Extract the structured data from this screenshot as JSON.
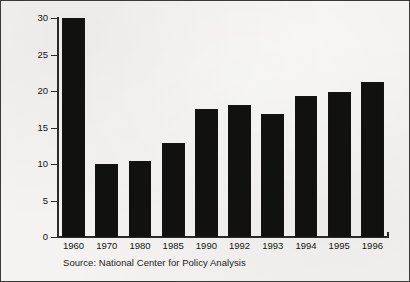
{
  "chart_data": {
    "type": "bar",
    "title": "",
    "xlabel": "",
    "ylabel": "Expected Prison Time (in days)",
    "categories": [
      "1960",
      "1970",
      "1980",
      "1985",
      "1990",
      "1992",
      "1993",
      "1994",
      "1995",
      "1996"
    ],
    "values": [
      30.0,
      10.0,
      10.4,
      12.9,
      17.6,
      18.1,
      16.9,
      19.3,
      19.8,
      21.3
    ],
    "ylim": [
      0,
      30
    ],
    "yticks": [
      0,
      5,
      10,
      15,
      20,
      25,
      30
    ],
    "ytick_labels": [
      "0",
      "5",
      "10",
      "15",
      "20",
      "25",
      "30"
    ],
    "grid": false,
    "legend": null,
    "bar_color": "#111110",
    "background_color": "#f4f3f1",
    "axis_color": "#2b2b29",
    "annotations": [
      "Source: National Center for Policy Analysis"
    ]
  },
  "figure": {
    "source_note": "Source: National Center for Policy Analysis"
  }
}
